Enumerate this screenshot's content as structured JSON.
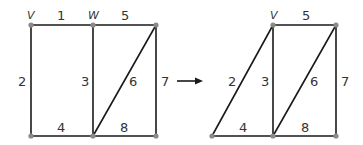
{
  "left_graph": {
    "vertex_labels": {
      "v": "V",
      "w": "W"
    },
    "edge_labels": {
      "e1": "1",
      "e2": "2",
      "e3": "3",
      "e4": "4",
      "e5": "5",
      "e6": "6",
      "e7": "7",
      "e8": "8"
    }
  },
  "arrow": {
    "direction": "right"
  },
  "right_graph": {
    "vertex_labels": {
      "v": "V"
    },
    "edge_labels": {
      "e2": "2",
      "e3": "3",
      "e4": "4",
      "e5": "5",
      "e6": "6",
      "e7": "7",
      "e8": "8"
    }
  },
  "colors": {
    "edge": "#1a1a1a",
    "node": "#8a8a8a",
    "label": "#333333"
  }
}
